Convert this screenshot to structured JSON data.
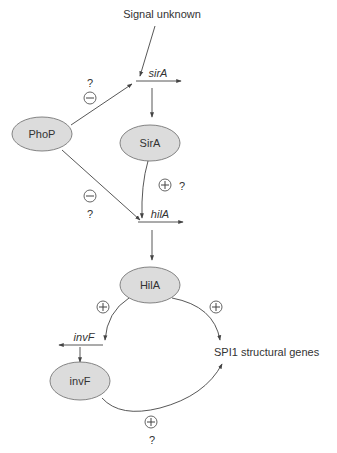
{
  "diagram": {
    "title": "",
    "signal_label": "Signal unknown",
    "genes": {
      "sirA": "sirA",
      "hilA": "hilA",
      "invF": "invF"
    },
    "proteins": {
      "PhoP": "PhoP",
      "SirA": "SirA",
      "HilA": "HilA",
      "invF": "invF"
    },
    "target_label": "SPI1 structural genes",
    "question_mark": "?",
    "colors": {
      "node_fill": "#dcdcdc",
      "node_stroke": "#777777",
      "edge": "#444444",
      "text": "#333333"
    },
    "edges": [
      {
        "from": "Signal unknown",
        "to": "sirA",
        "sign": "",
        "uncertain": false
      },
      {
        "from": "PhoP",
        "to": "sirA",
        "sign": "-",
        "uncertain": true
      },
      {
        "from": "sirA",
        "to": "SirA",
        "sign": "",
        "uncertain": false
      },
      {
        "from": "SirA",
        "to": "hilA",
        "sign": "+",
        "uncertain": true
      },
      {
        "from": "PhoP",
        "to": "hilA",
        "sign": "-",
        "uncertain": true
      },
      {
        "from": "hilA",
        "to": "HilA",
        "sign": "",
        "uncertain": false
      },
      {
        "from": "HilA",
        "to": "invF gene",
        "sign": "+",
        "uncertain": false
      },
      {
        "from": "HilA",
        "to": "SPI1 structural genes",
        "sign": "+",
        "uncertain": false
      },
      {
        "from": "invF gene",
        "to": "invF",
        "sign": "",
        "uncertain": false
      },
      {
        "from": "invF",
        "to": "SPI1 structural genes",
        "sign": "+",
        "uncertain": true
      }
    ]
  }
}
